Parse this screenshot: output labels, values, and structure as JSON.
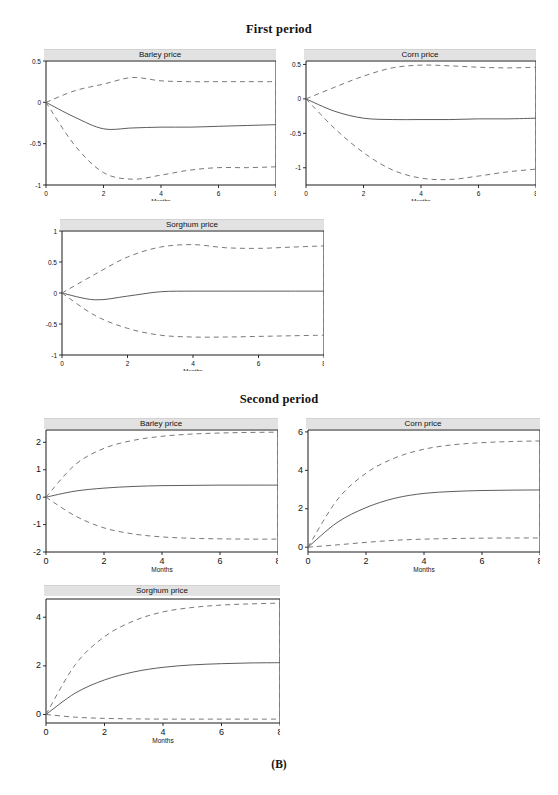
{
  "figure": {
    "caption": "(B)",
    "sections": [
      {
        "id": "first",
        "title": "First period"
      },
      {
        "id": "second",
        "title": "Second period"
      }
    ]
  },
  "panels": {
    "first_barley": {
      "title": "Barley price",
      "xlabel": "Months"
    },
    "first_corn": {
      "title": "Corn price",
      "xlabel": "Months"
    },
    "first_sorghum": {
      "title": "Sorghum price",
      "xlabel": "Months"
    },
    "second_barley": {
      "title": "Barley price",
      "xlabel": "Months"
    },
    "second_corn": {
      "title": "Corn price",
      "xlabel": "Months"
    },
    "second_sorghum": {
      "title": "Sorghum price",
      "xlabel": "Months"
    }
  },
  "chart_data": [
    {
      "id": "first_barley",
      "type": "line",
      "title": "Barley price",
      "section": "First period",
      "xlabel": "Months",
      "ylabel": "",
      "xlim": [
        0,
        8
      ],
      "ylim": [
        -1,
        0.5
      ],
      "xticks": [
        0,
        2,
        4,
        6,
        8
      ],
      "xtick_labels": [
        "0",
        "2",
        "4",
        "6",
        "8"
      ],
      "yticks": [
        0.5,
        0,
        -0.5,
        -1
      ],
      "ytick_labels": [
        "0.5",
        "0",
        "-0.5",
        "-1"
      ],
      "grid": false,
      "legend": "none",
      "x": [
        0,
        1,
        2,
        3,
        4,
        5,
        6,
        7,
        8
      ],
      "series": [
        {
          "name": "impulse response",
          "style": "solid",
          "values": [
            0,
            -0.18,
            -0.32,
            -0.31,
            -0.3,
            -0.3,
            -0.29,
            -0.28,
            -0.27
          ]
        },
        {
          "name": "upper confidence band",
          "style": "dashed",
          "values": [
            0,
            0.14,
            0.22,
            0.3,
            0.26,
            0.25,
            0.25,
            0.25,
            0.25
          ]
        },
        {
          "name": "lower confidence band",
          "style": "dashed",
          "values": [
            0,
            -0.52,
            -0.85,
            -0.93,
            -0.88,
            -0.82,
            -0.79,
            -0.79,
            -0.78
          ]
        }
      ]
    },
    {
      "id": "first_corn",
      "type": "line",
      "title": "Corn price",
      "section": "First period",
      "xlabel": "Months",
      "ylabel": "",
      "xlim": [
        0,
        8
      ],
      "ylim": [
        -1.25,
        0.55
      ],
      "xticks": [
        0,
        2,
        4,
        6,
        8
      ],
      "xtick_labels": [
        "0",
        "2",
        "4",
        "6",
        "8"
      ],
      "yticks": [
        0.5,
        0,
        -0.5,
        -1
      ],
      "ytick_labels": [
        "0.5",
        "0",
        "-0.5",
        "-1"
      ],
      "grid": false,
      "legend": "none",
      "x": [
        0,
        1,
        2,
        3,
        4,
        5,
        6,
        7,
        8
      ],
      "series": [
        {
          "name": "impulse response",
          "style": "solid",
          "values": [
            0,
            -0.18,
            -0.28,
            -0.3,
            -0.3,
            -0.3,
            -0.29,
            -0.29,
            -0.28
          ]
        },
        {
          "name": "upper confidence band",
          "style": "dashed",
          "values": [
            0,
            0.17,
            0.33,
            0.45,
            0.49,
            0.48,
            0.46,
            0.45,
            0.46
          ]
        },
        {
          "name": "lower confidence band",
          "style": "dashed",
          "values": [
            0,
            -0.43,
            -0.78,
            -1.03,
            -1.15,
            -1.17,
            -1.12,
            -1.06,
            -1.02
          ]
        }
      ]
    },
    {
      "id": "first_sorghum",
      "type": "line",
      "title": "Sorghum price",
      "section": "First period",
      "xlabel": "Months",
      "ylabel": "",
      "xlim": [
        0,
        8
      ],
      "ylim": [
        -1,
        1
      ],
      "xticks": [
        0,
        2,
        4,
        6,
        8
      ],
      "xtick_labels": [
        "0",
        "2",
        "4",
        "6",
        "8"
      ],
      "yticks": [
        1,
        0.5,
        0,
        -0.5,
        -1
      ],
      "ytick_labels": [
        "1",
        "0.5",
        "0",
        "-0.5",
        "-1"
      ],
      "grid": false,
      "legend": "none",
      "x": [
        0,
        1,
        2,
        3,
        4,
        5,
        6,
        7,
        8
      ],
      "series": [
        {
          "name": "impulse response",
          "style": "solid",
          "values": [
            0,
            -0.11,
            -0.05,
            0.02,
            0.03,
            0.03,
            0.03,
            0.03,
            0.03
          ]
        },
        {
          "name": "upper confidence band",
          "style": "dashed",
          "values": [
            0,
            0.3,
            0.58,
            0.74,
            0.78,
            0.73,
            0.72,
            0.74,
            0.76
          ]
        },
        {
          "name": "lower confidence band",
          "style": "dashed",
          "values": [
            0,
            -0.36,
            -0.57,
            -0.68,
            -0.71,
            -0.71,
            -0.7,
            -0.69,
            -0.68
          ]
        }
      ]
    },
    {
      "id": "second_barley",
      "type": "line",
      "title": "Barley price",
      "section": "Second period",
      "xlabel": "Months",
      "ylabel": "",
      "xlim": [
        0,
        8
      ],
      "ylim": [
        -2,
        2.45
      ],
      "xticks": [
        0,
        2,
        4,
        6,
        8
      ],
      "xtick_labels": [
        "0",
        "2",
        "4",
        "6",
        "8"
      ],
      "yticks": [
        2,
        1,
        0,
        -1,
        -2
      ],
      "ytick_labels": [
        "2",
        "1",
        "0",
        "-1",
        "-2"
      ],
      "grid": false,
      "legend": "none",
      "x": [
        0,
        1,
        2,
        3,
        4,
        5,
        6,
        7,
        8
      ],
      "series": [
        {
          "name": "impulse response",
          "style": "solid",
          "values": [
            0,
            0.22,
            0.33,
            0.39,
            0.42,
            0.43,
            0.44,
            0.44,
            0.44
          ]
        },
        {
          "name": "upper confidence band",
          "style": "dashed",
          "values": [
            0,
            1.18,
            1.78,
            2.07,
            2.22,
            2.3,
            2.34,
            2.36,
            2.37
          ]
        },
        {
          "name": "lower confidence band",
          "style": "dashed",
          "values": [
            0,
            -0.68,
            -1.12,
            -1.34,
            -1.45,
            -1.5,
            -1.52,
            -1.53,
            -1.53
          ]
        }
      ]
    },
    {
      "id": "second_corn",
      "type": "line",
      "title": "Corn price",
      "section": "Second period",
      "xlabel": "Months",
      "ylabel": "",
      "xlim": [
        0,
        8
      ],
      "ylim": [
        -0.25,
        6.1
      ],
      "xticks": [
        0,
        2,
        4,
        6,
        8
      ],
      "xtick_labels": [
        "0",
        "2",
        "4",
        "6",
        "8"
      ],
      "yticks": [
        6,
        4,
        2,
        0
      ],
      "ytick_labels": [
        "6",
        "4",
        "2",
        "0"
      ],
      "grid": false,
      "legend": "none",
      "x": [
        0,
        1,
        2,
        3,
        4,
        5,
        6,
        7,
        8
      ],
      "series": [
        {
          "name": "impulse response",
          "style": "solid",
          "values": [
            0,
            1.28,
            2.06,
            2.55,
            2.8,
            2.9,
            2.95,
            2.97,
            2.98
          ]
        },
        {
          "name": "upper confidence band",
          "style": "dashed",
          "values": [
            0,
            2.45,
            3.85,
            4.65,
            5.1,
            5.33,
            5.44,
            5.5,
            5.53
          ]
        },
        {
          "name": "lower confidence band",
          "style": "dashed",
          "values": [
            0,
            0.12,
            0.25,
            0.36,
            0.42,
            0.45,
            0.47,
            0.48,
            0.48
          ]
        }
      ]
    },
    {
      "id": "second_sorghum",
      "type": "line",
      "title": "Sorghum price",
      "section": "Second period",
      "xlabel": "Months",
      "ylabel": "",
      "xlim": [
        0,
        8
      ],
      "ylim": [
        -0.35,
        4.75
      ],
      "xticks": [
        0,
        2,
        4,
        6,
        8
      ],
      "xtick_labels": [
        "0",
        "2",
        "4",
        "6",
        "8"
      ],
      "yticks": [
        4,
        2,
        0
      ],
      "ytick_labels": [
        "4",
        "2",
        "0"
      ],
      "grid": false,
      "legend": "none",
      "x": [
        0,
        1,
        2,
        3,
        4,
        5,
        6,
        7,
        8
      ],
      "series": [
        {
          "name": "impulse response",
          "style": "solid",
          "values": [
            0,
            0.88,
            1.42,
            1.75,
            1.94,
            2.04,
            2.09,
            2.12,
            2.13
          ]
        },
        {
          "name": "upper confidence band",
          "style": "dashed",
          "values": [
            0,
            2.05,
            3.2,
            3.85,
            4.22,
            4.4,
            4.5,
            4.55,
            4.58
          ]
        },
        {
          "name": "lower confidence band",
          "style": "dashed",
          "values": [
            0,
            -0.11,
            -0.16,
            -0.18,
            -0.19,
            -0.19,
            -0.19,
            -0.19,
            -0.19
          ]
        }
      ]
    }
  ]
}
